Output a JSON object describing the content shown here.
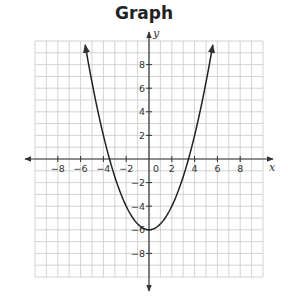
{
  "title": "Graph",
  "chart_data": {
    "type": "line",
    "title": "Graph",
    "xlabel": "x",
    "ylabel": "y",
    "xlim": [
      -10,
      10
    ],
    "ylim": [
      -10,
      10
    ],
    "grid": true,
    "x_ticks": [
      -8,
      -6,
      -4,
      -2,
      2,
      4,
      6,
      8
    ],
    "y_ticks": [
      8,
      6,
      4,
      2,
      -2,
      -4,
      -6,
      -8
    ],
    "origin_label": "0",
    "series": [
      {
        "name": "parabola",
        "equation": "y = 0.5x^2 - 6",
        "vertex": [
          0,
          -6
        ],
        "x_intercepts": [
          -3.46,
          3.46
        ],
        "x": [
          -5.6,
          -5,
          -4,
          -3,
          -2,
          -1,
          0,
          1,
          2,
          3,
          4,
          5,
          5.6
        ],
        "y": [
          9.68,
          6.5,
          2,
          -1.5,
          -4,
          -5.5,
          -6,
          -5.5,
          -4,
          -1.5,
          2,
          6.5,
          9.68
        ],
        "arrows_both_ends": true
      }
    ]
  },
  "colors": {
    "grid": "#c8c8c8",
    "axis": "#333333",
    "curve": "#222222"
  }
}
